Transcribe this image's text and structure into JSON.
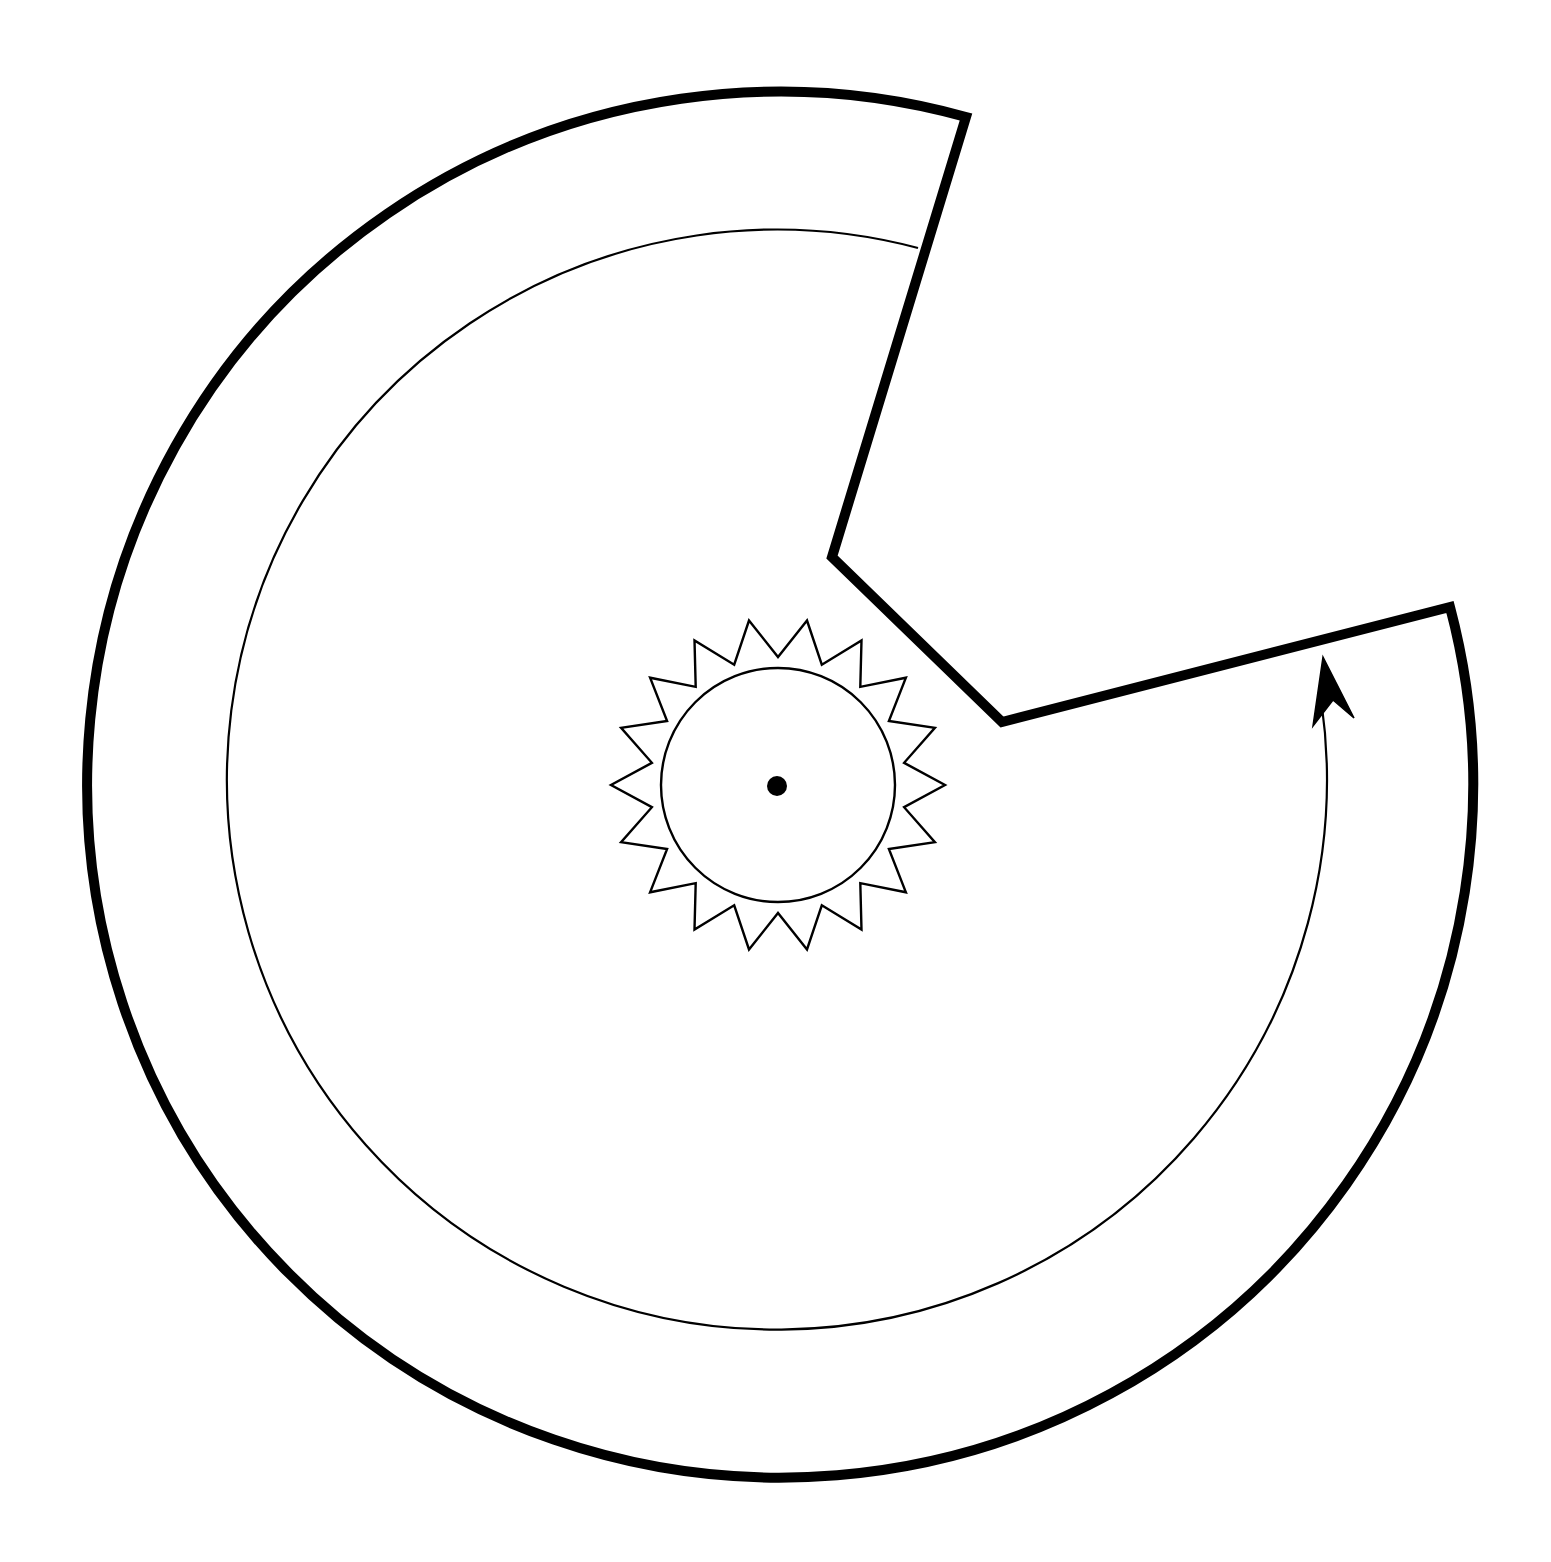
{
  "diagram": {
    "colors": {
      "stroke": "#000000",
      "background": "#ffffff"
    },
    "center": [
      778,
      787
    ],
    "outer_radius": 693,
    "inner_track_radius": 550,
    "hub_radius": 117,
    "gear": {
      "teeth": 18,
      "outer_radius": 167,
      "inner_radius": 128
    },
    "notch_points": [
      [
        966,
        117
      ],
      [
        832,
        557
      ],
      [
        1002,
        722
      ],
      [
        1450,
        607
      ]
    ],
    "arrow": {
      "direction": "counterclockwise",
      "icon": "arrow-up-icon"
    },
    "center_dot_radius": 10
  }
}
